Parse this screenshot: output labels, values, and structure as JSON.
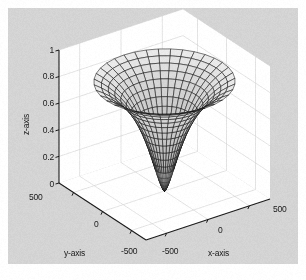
{
  "figure": {
    "background_color": "#d4d4d4",
    "wall_color": "#ffffff",
    "grid_color": "#d0d0d0",
    "axis_line_color": "#1a1a1a",
    "mesh_line_color": "#111111",
    "surface_face_color": "#b8b8b8",
    "page_color": "#ffffff"
  },
  "axes": {
    "x": {
      "title": "x-axis",
      "ticks": [
        "-500",
        "0",
        "500"
      ],
      "values": [
        -500,
        0,
        500
      ],
      "limits": [
        -750,
        750
      ]
    },
    "y": {
      "title": "y-axis",
      "ticks": [
        "500",
        "0",
        "-500"
      ],
      "values": [
        500,
        0,
        -500
      ],
      "limits": [
        -750,
        750
      ]
    },
    "z": {
      "title": "z-axis",
      "ticks": [
        "1",
        "0.8",
        "0.6",
        "0.4",
        "0.2",
        "0"
      ],
      "values": [
        1,
        0.8,
        0.6,
        0.4,
        0.2,
        0
      ],
      "limits": [
        0,
        1
      ]
    }
  },
  "chart_data": {
    "type": "surface",
    "title": "",
    "xlabel": "x-axis",
    "ylabel": "y-axis",
    "zlabel": "z-axis",
    "xlim": [
      -750,
      750
    ],
    "ylim": [
      -750,
      750
    ],
    "zlim": [
      0,
      1
    ],
    "xticks": [
      -500,
      0,
      500
    ],
    "yticks": [
      -500,
      0,
      500
    ],
    "zticks": [
      0,
      0.2,
      0.4,
      0.6,
      0.8,
      1
    ],
    "grid": true,
    "legend": "none",
    "mesh": {
      "radial_lines": 36,
      "ring_lines": 24,
      "shading": "faceted-gray"
    },
    "surface_formula": "z = 1 - 1 / (1 + (r / r0)^p)",
    "surface_params": {
      "r0": 260,
      "p": 1.55,
      "rim_radius": 700,
      "rim_z": 1.0,
      "center_z": 0.0
    },
    "view": {
      "azimuth_deg": -37.5,
      "elevation_deg": 30
    }
  }
}
